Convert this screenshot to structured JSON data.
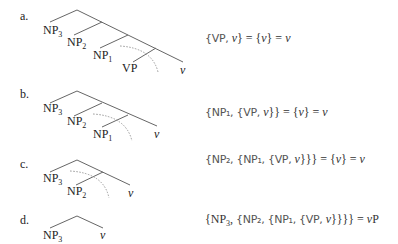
{
  "rows": [
    {
      "marker": "a.",
      "leaves": [
        "NP3",
        "NP2",
        "NP1",
        "VP",
        "v"
      ],
      "equation": "{VP, v} = {v} = v",
      "equation_parts": {
        "lhs_set": "{VP, v}",
        "mid": "= {v} =",
        "result": "v"
      }
    },
    {
      "marker": "b.",
      "leaves": [
        "NP3",
        "NP2",
        "NP1",
        "v"
      ],
      "equation": "{NP1, {VP, v}} = {v} = v",
      "equation_parts": {
        "lhs_set": "{NP1, {VP, v}}",
        "mid": "= {v} =",
        "result": "v"
      }
    },
    {
      "marker": "c.",
      "leaves": [
        "NP3",
        "NP2",
        "v"
      ],
      "equation": "{NP2, {NP1, {VP, v}}} = {v} = v",
      "equation_parts": {
        "lhs_set": "{NP2, {NP1, {VP, v}}}",
        "mid": "= {v} =",
        "result": "v"
      }
    },
    {
      "marker": "d.",
      "leaves": [
        "NP3",
        "v"
      ],
      "equation": "{NP3, {NP2, {NP1, {VP, v}}}} = vP",
      "equation_parts": {
        "lhs_set": "{NP3, {NP2, {NP1, {VP, v}}}}",
        "mid": "=",
        "result": "vP"
      }
    }
  ],
  "colors": {
    "line": "#666666",
    "dotted": "#999999",
    "text": "#222222"
  }
}
